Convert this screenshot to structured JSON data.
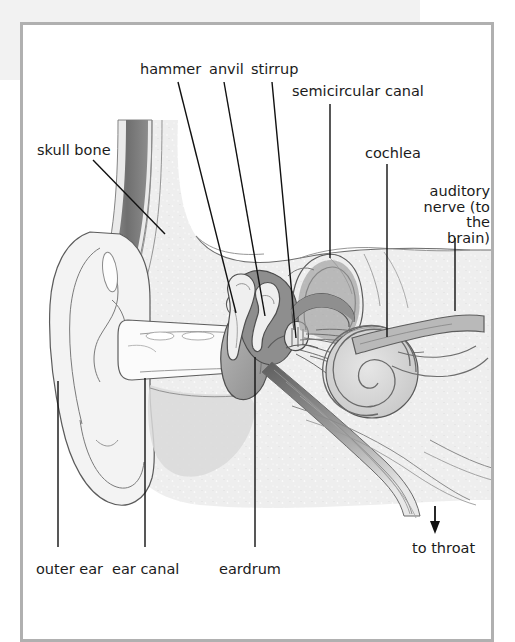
{
  "figure": {
    "background_color": "#ffffff",
    "frame_color": "#b0b0b0",
    "text_color": "#1b1b1b"
  },
  "labels": [
    {
      "id": "hammer",
      "text": "hammer",
      "x": 140,
      "y": 62
    },
    {
      "id": "anvil",
      "text": "anvil",
      "x": 209,
      "y": 62
    },
    {
      "id": "stirrup",
      "text": "stirrup",
      "x": 251,
      "y": 62
    },
    {
      "id": "semicircular-canal",
      "text": "semicircular canal",
      "x": 292,
      "y": 84
    },
    {
      "id": "skull-bone",
      "text": "skull bone",
      "x": 37,
      "y": 143
    },
    {
      "id": "cochlea",
      "text": "cochlea",
      "x": 365,
      "y": 146
    },
    {
      "id": "auditory-nerve",
      "text": "auditory nerve (to the brain)",
      "x": 420,
      "y": 184
    },
    {
      "id": "outer-ear",
      "text": "outer ear",
      "x": 36,
      "y": 562
    },
    {
      "id": "ear-canal",
      "text": "ear canal",
      "x": 112,
      "y": 562
    },
    {
      "id": "eardrum",
      "text": "eardrum",
      "x": 219,
      "y": 562
    },
    {
      "id": "to-throat",
      "text": "to throat",
      "x": 412,
      "y": 541
    }
  ],
  "leader_lines": [
    {
      "id": "hammer-leader",
      "points": "178,82 236,313"
    },
    {
      "id": "anvil-leader",
      "points": "224,82 265,316"
    },
    {
      "id": "stirrup-leader",
      "points": "272,82 296,338"
    },
    {
      "id": "semicircular-canal-leader",
      "points": "330,104 330,258"
    },
    {
      "id": "skull-bone-leader",
      "points": "93,160 165,234"
    },
    {
      "id": "cochlea-leader",
      "points": "387,164 387,337"
    },
    {
      "id": "auditory-nerve-leader",
      "points": "455,238 455,311"
    },
    {
      "id": "outer-ear-leader",
      "points": "58,381 58,547"
    },
    {
      "id": "ear-canal-leader",
      "points": "145,378 145,547"
    },
    {
      "id": "eardrum-leader",
      "points": "255,357 255,547"
    }
  ],
  "throat_arrow": {
    "id": "to-throat-arrow",
    "x": 435,
    "y_start": 506,
    "y_end": 532
  },
  "anatomy_parts": [
    "outer ear (pinna)",
    "ear canal",
    "eardrum",
    "hammer (malleus)",
    "anvil (incus)",
    "stirrup (stapes)",
    "semicircular canal",
    "cochlea",
    "auditory nerve",
    "skull bone",
    "eustachian tube to throat"
  ],
  "palette": {
    "tissue_light": "#f4f4f4",
    "tissue_mid": "#dcdcdc",
    "tissue_shadow": "#c3c3c3",
    "bone_dark": "#7d7d7d",
    "bone_mid": "#a0a0a0",
    "outline": "#555555",
    "ink": "#111111"
  }
}
